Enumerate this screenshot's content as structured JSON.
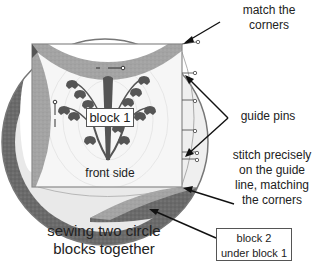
{
  "diagram": {
    "title": "sewing two circle blocks together",
    "title_lines": [
      "sewing two circle",
      "blocks together"
    ],
    "colors": {
      "outer_ring": "#6e6e6e",
      "inner_arc": "#a3a3a3",
      "block_bg": "#f4f4f4",
      "block2_edge": "#e3e3e3",
      "flower": "#555555",
      "outline": "#777777",
      "arrow": "#111111",
      "text": "#222222"
    },
    "block1": {
      "label": "block 1",
      "side_label": "front side"
    },
    "block2": {
      "label_lines": [
        "block 2",
        "under block 1"
      ]
    },
    "callouts": [
      {
        "id": "match-corners",
        "lines": [
          "match the",
          "corners"
        ]
      },
      {
        "id": "guide-pins",
        "lines": [
          "guide pins"
        ]
      },
      {
        "id": "stitch-precisely",
        "lines": [
          "stitch precisely",
          "on the guide",
          "line, matching",
          "the corners"
        ]
      }
    ]
  }
}
